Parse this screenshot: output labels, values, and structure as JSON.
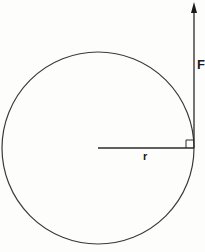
{
  "diagram": {
    "type": "torque-force-diagram",
    "labels": {
      "force": "F",
      "radius": "r"
    },
    "elements": {
      "circle": {
        "cx": 98,
        "cy": 148,
        "radius_px": 96
      },
      "radius_line": {
        "from": [
          98,
          148
        ],
        "to": [
          194,
          148
        ]
      },
      "force_arrow": {
        "from": [
          194,
          148
        ],
        "to": [
          194,
          3
        ],
        "direction": "up"
      },
      "right_angle_marker": {
        "corner": [
          194,
          148
        ],
        "size_px": 8
      }
    },
    "colors": {
      "stroke": "#3a3a3a",
      "text": "#1a1a1a",
      "background": "#fdfdfc"
    }
  }
}
